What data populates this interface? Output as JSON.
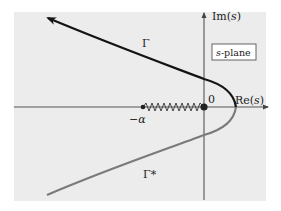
{
  "figure": {
    "plane_label_var": "s",
    "plane_label_suffix": "-plane",
    "colors": {
      "background": "#ffffff",
      "panel": "#ececec",
      "axis": "#555555",
      "upper_curve": "#141414",
      "lower_curve": "#7a7a7a",
      "branch_cut": "#333333",
      "points": "#222222"
    }
  },
  "axes": {
    "real_label": "Re(s)",
    "imag_label": "Im(s)",
    "origin_label": "0"
  },
  "points": [
    {
      "name": "minus-alpha",
      "label": "−α"
    },
    {
      "name": "origin",
      "label": "0"
    }
  ],
  "curves": [
    {
      "name": "gamma",
      "label": "Γ",
      "direction": "toward upper-left (arrow)"
    },
    {
      "name": "gamma-conjugate",
      "label": "Γ*"
    }
  ],
  "branch_cut": {
    "from": "−α",
    "to": "0",
    "style": "zigzag"
  }
}
